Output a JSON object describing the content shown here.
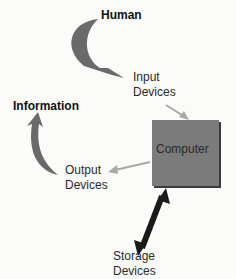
{
  "diagram": {
    "nodes": {
      "human": "Human",
      "input_line1": "Input",
      "input_line2": "Devices",
      "information": "Information",
      "computer": "Computer",
      "output_line1": "Output",
      "output_line2": "Devices",
      "storage_line1": "Storage",
      "storage_line2": "Devices"
    },
    "edges": [
      {
        "from": "Human",
        "to": "Input Devices",
        "style": "curved-block-arrow"
      },
      {
        "from": "Input Devices",
        "to": "Computer",
        "style": "thin-arrow"
      },
      {
        "from": "Computer",
        "to": "Output Devices",
        "style": "thin-arrow"
      },
      {
        "from": "Output Devices",
        "to": "Information",
        "style": "curved-block-arrow"
      },
      {
        "from": "Computer",
        "to": "Storage Devices",
        "style": "double-headed-arrow"
      }
    ],
    "colors": {
      "block_arrow": "#6a6a6a",
      "thin_arrow": "#a8a8a8",
      "computer_fill": "#7b7b7b",
      "storage_arrow": "#1a1a1a"
    }
  }
}
